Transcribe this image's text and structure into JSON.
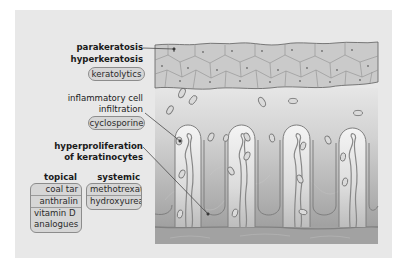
{
  "diagram": {
    "labels": {
      "parakeratosis": "parakeratosis",
      "hyperkeratosis": "hyperkeratosis",
      "inflammatory_line1": "inflammatory cell",
      "inflammatory_line2": "infiltration",
      "hyperproliferation_line1": "hyperproliferation",
      "hyperproliferation_line2": "of keratinocytes"
    },
    "treatments": {
      "keratolytics": "keratolytics",
      "cyclosporine": "cyclosporine"
    },
    "groups": {
      "topical": {
        "heading": "topical",
        "items": [
          "coal tar",
          "anthralin",
          "vitamin D analogues"
        ],
        "item_lines": [
          "coal tar",
          "anthralin",
          "vitamin D",
          "analogues"
        ]
      },
      "systemic": {
        "heading": "systemic",
        "items": [
          "methotrexate",
          "hydroxyurea"
        ]
      }
    },
    "colors": {
      "panel_bg": "#e8e8e8",
      "stratum_corneum": "#c8c8c8",
      "cell_outline": "#8a8a8a",
      "epidermis_gradient_top": "#dcdcdc",
      "epidermis_gradient_bottom": "#9e9e9e",
      "papilla_fill": "#ececec",
      "vessel": "#8a8a8a",
      "pill_bg": "#d6d6d6",
      "text": "#1a1a1a"
    }
  }
}
